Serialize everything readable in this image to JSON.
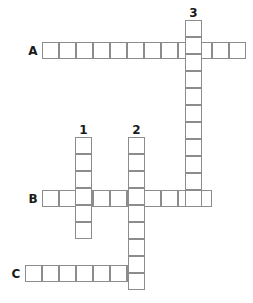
{
  "puzzle": {
    "type": "crossword-grid",
    "width": 253,
    "height": 303,
    "cell_size": 17,
    "background_color": "#ffffff",
    "cell_border_color": "#8c8c8c",
    "label_color": "#1a1a1a",
    "row_labels": [
      {
        "label": "A",
        "x": 26,
        "y": 45,
        "row_y": 42,
        "row_x": 42,
        "length": 12
      },
      {
        "label": "B",
        "x": 26,
        "y": 193,
        "row_y": 190,
        "row_x": 42,
        "length": 10
      },
      {
        "label": "C",
        "x": 9,
        "y": 268,
        "row_y": 265,
        "row_x": 25,
        "length": 7
      }
    ],
    "column_numbers": [
      {
        "label": "1",
        "x": 75,
        "y": 124,
        "col_x": 75,
        "col_y": 137,
        "length": 6
      },
      {
        "label": "2",
        "x": 128,
        "y": 124,
        "col_x": 128,
        "col_y": 137,
        "length": 9
      },
      {
        "label": "3",
        "x": 185,
        "y": 7,
        "col_x": 185,
        "col_y": 20,
        "length": 11
      }
    ],
    "across_entries": [
      {
        "id": "A",
        "label": "A",
        "start_x": 42,
        "start_y": 42,
        "cells": 12,
        "values": [
          "",
          "",
          "",
          "",
          "",
          "",
          "",
          "",
          "",
          "",
          "",
          ""
        ]
      },
      {
        "id": "B",
        "label": "B",
        "start_x": 42,
        "start_y": 190,
        "cells": 10,
        "values": [
          "",
          "",
          "",
          "",
          "",
          "",
          "",
          "",
          "",
          ""
        ]
      },
      {
        "id": "C",
        "label": "C",
        "start_x": 25,
        "start_y": 265,
        "cells": 7,
        "values": [
          "",
          "",
          "",
          "",
          "",
          "",
          ""
        ]
      }
    ],
    "down_entries": [
      {
        "id": "1",
        "label": "1",
        "start_x": 75,
        "start_y": 137,
        "cells": 6,
        "values": [
          "",
          "",
          "",
          "",
          "",
          ""
        ]
      },
      {
        "id": "2",
        "label": "2",
        "start_x": 128,
        "start_y": 137,
        "cells": 9,
        "values": [
          "",
          "",
          "",
          "",
          "",
          "",
          "",
          "",
          ""
        ]
      },
      {
        "id": "3",
        "label": "3",
        "start_x": 185,
        "start_y": 20,
        "cells": 11,
        "values": [
          "",
          "",
          "",
          "",
          "",
          "",
          "",
          "",
          "",
          "",
          ""
        ]
      }
    ]
  }
}
